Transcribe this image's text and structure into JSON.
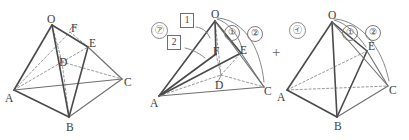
{
  "figure": {
    "caption_kind": "solid-geometry-decomposition",
    "operator": "+",
    "panels": [
      {
        "id": "panel-original",
        "name": "original-solid",
        "tag": "",
        "vertices": [
          {
            "key": "O",
            "label": "O",
            "x": 51,
            "y": 22
          },
          {
            "key": "F",
            "label": "F",
            "x": 74,
            "y": 30
          },
          {
            "key": "E",
            "label": "E",
            "x": 93,
            "y": 45
          },
          {
            "key": "D",
            "label": "D",
            "x": 63,
            "y": 63
          },
          {
            "key": "A",
            "label": "A",
            "x": 10,
            "y": 92
          },
          {
            "key": "B",
            "label": "B",
            "x": 70,
            "y": 123
          },
          {
            "key": "C",
            "label": "C",
            "x": 126,
            "y": 80
          }
        ]
      },
      {
        "id": "panel-part-a",
        "name": "part-solid-a",
        "tag": "㋐",
        "vertices": [
          {
            "key": "O",
            "label": "O",
            "x": 214,
            "y": 17
          },
          {
            "key": "F",
            "label": "F",
            "x": 218,
            "y": 51
          },
          {
            "key": "E",
            "label": "E",
            "x": 243,
            "y": 50
          },
          {
            "key": "D",
            "label": "D",
            "x": 221,
            "y": 78
          },
          {
            "key": "A",
            "label": "A",
            "x": 155,
            "y": 98
          },
          {
            "key": "C",
            "label": "C",
            "x": 268,
            "y": 88
          }
        ],
        "markers": [
          {
            "key": "box1",
            "label": "1",
            "x": 184,
            "y": 19,
            "kind": "box"
          },
          {
            "key": "box2",
            "label": "2",
            "x": 172,
            "y": 41,
            "kind": "box"
          },
          {
            "key": "circ1",
            "label": "①",
            "x": 229,
            "y": 30,
            "kind": "circle"
          },
          {
            "key": "circ2",
            "label": "②",
            "x": 252,
            "y": 31,
            "kind": "circle"
          }
        ]
      },
      {
        "id": "panel-part-b",
        "name": "part-solid-b",
        "tag": "㋑",
        "vertices": [
          {
            "key": "O",
            "label": "O",
            "x": 331,
            "y": 18
          },
          {
            "key": "E",
            "label": "E",
            "x": 370,
            "y": 48
          },
          {
            "key": "A",
            "label": "A",
            "x": 282,
            "y": 92
          },
          {
            "key": "B",
            "label": "B",
            "x": 338,
            "y": 122
          },
          {
            "key": "C",
            "label": "C",
            "x": 392,
            "y": 87
          }
        ],
        "markers": [
          {
            "key": "circ1",
            "label": "①",
            "x": 347,
            "y": 30,
            "kind": "circle"
          },
          {
            "key": "circ2",
            "label": "②",
            "x": 370,
            "y": 30,
            "kind": "circle"
          }
        ]
      }
    ],
    "colors": {
      "edge": "#4a4a4a",
      "hidden_edge": "#8d8d8d",
      "annotation": "#7a7a7a",
      "background": "#ffffff"
    }
  }
}
